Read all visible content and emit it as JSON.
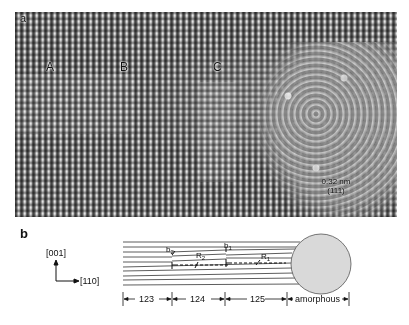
{
  "figure": {
    "panel_a": {
      "label": "a",
      "region_labels": [
        "A",
        "B",
        "C"
      ],
      "scale_text": "0.32 nm",
      "scale_plane": "(111)"
    },
    "panel_b": {
      "label": "b",
      "axes": {
        "vertical": "[001]",
        "horizontal": "[110]"
      },
      "dislocation_labels": {
        "b2": "b",
        "b2_sub": "2",
        "b1": "b",
        "b1_sub": "1",
        "R2": "R",
        "R2_sub": "2",
        "R1": "R",
        "R1_sub": "1"
      },
      "segments": [
        "123",
        "124",
        "125",
        "amorphous"
      ]
    }
  }
}
